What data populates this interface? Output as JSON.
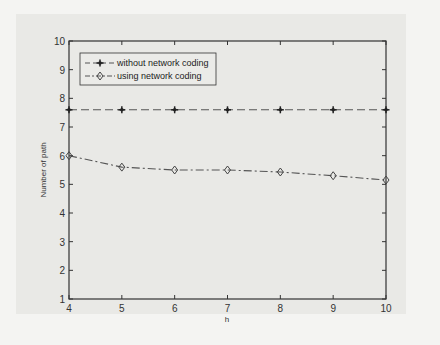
{
  "chart_data": {
    "type": "line",
    "title": "",
    "xlabel": "h",
    "ylabel": "Number of path",
    "xlim": [
      4,
      10
    ],
    "ylim": [
      1,
      10
    ],
    "x_ticks": [
      "4",
      "5",
      "6",
      "7",
      "8",
      "9",
      "10"
    ],
    "y_ticks": [
      "1",
      "2",
      "3",
      "4",
      "5",
      "6",
      "7",
      "8",
      "9",
      "10"
    ],
    "grid": false,
    "legend_position": "upper left",
    "x": [
      4,
      5,
      6,
      7,
      8,
      9,
      10
    ],
    "series": [
      {
        "name": "without network coding",
        "marker": "star",
        "linestyle": "dashed",
        "values": [
          7.6,
          7.6,
          7.6,
          7.6,
          7.6,
          7.6,
          7.6
        ]
      },
      {
        "name": "using network coding",
        "marker": "diamond",
        "linestyle": "dash-dot",
        "values": [
          6.0,
          5.6,
          5.5,
          5.5,
          5.43,
          5.3,
          5.15
        ]
      }
    ]
  }
}
